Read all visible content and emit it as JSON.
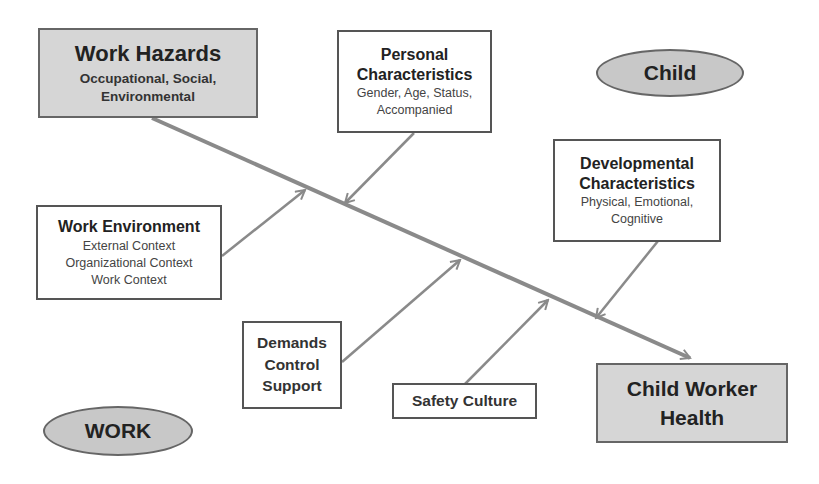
{
  "diagram": {
    "type": "fishbone",
    "colors": {
      "line": "#8a8a8a",
      "shaded_fill": "#d6d6d6",
      "oval_fill": "#c8c8c8",
      "border": "#555555"
    },
    "head": {
      "id": "work_hazards",
      "title": "Work Hazards",
      "subtitle_line1": "Occupational,  Social,",
      "subtitle_line2": "Environmental"
    },
    "outcome": {
      "id": "child_worker_health",
      "title_line1": "Child Worker",
      "title_line2": "Health"
    },
    "labels": {
      "child": "Child",
      "work": "WORK"
    },
    "factors": [
      {
        "id": "personal",
        "title_line1": "Personal",
        "title_line2": "Characteristics",
        "sub_line1": "Gender, Age, Status,",
        "sub_line2": "Accompanied"
      },
      {
        "id": "developmental",
        "title_line1": "Developmental",
        "title_line2": "Characteristics",
        "sub_line1": "Physical, Emotional,",
        "sub_line2": "Cognitive"
      },
      {
        "id": "work_environment",
        "title": "Work Environment",
        "sub_line1": "External Context",
        "sub_line2": "Organizational Context",
        "sub_line3": "Work Context"
      },
      {
        "id": "dcs",
        "line1": "Demands",
        "line2": "Control",
        "line3": "Support"
      },
      {
        "id": "safety",
        "label": "Safety Culture"
      }
    ]
  }
}
